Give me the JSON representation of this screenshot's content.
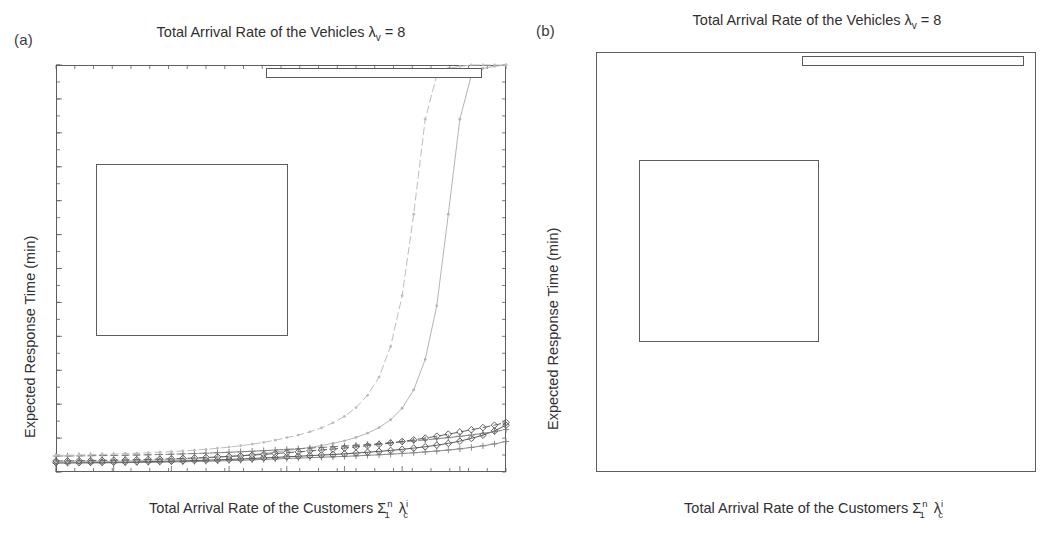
{
  "figure": {
    "panels": [
      {
        "id": "a",
        "label": "(a)",
        "title_main": "Total Arrival Rate of the Vehicles ",
        "title_lambda": "λ",
        "title_lambda_sub": "v",
        "title_tail": " = 8",
        "ylabel": "Expected Response Time (min)",
        "xlabel_main": "Total Arrival Rate of the Customers ",
        "xlabel_sigma": "Σ",
        "xlabel_sigma_sup": "n",
        "xlabel_sigma_sub": "1",
        "xlabel_lambda": "λ",
        "xlabel_lambda_sup": "i",
        "xlabel_lambda_sub": "c",
        "yticks": [
          "0",
          "5",
          "10",
          "15",
          "20",
          "25",
          "30",
          "35",
          "40",
          "45",
          "50",
          "55",
          "60"
        ],
        "xticks": [
          "2",
          "2.5",
          "3",
          "3.5",
          "4",
          "4.5",
          "5",
          "5.5"
        ],
        "legend": [
          "Gaussian/Gaussian,Average",
          "Decreasing/Gaussian, Average",
          "Decreasing/Uniform, Average",
          "Gaussian/Gaussian,Max",
          "Decreasing/Gaussian,Max",
          "Decreasing/Uniform, Max"
        ],
        "inset": {
          "yticks": [
            "1.5",
            "3.5",
            "5.5",
            "7.5",
            "9.5"
          ],
          "xticks": [
            "4.5",
            "5",
            "5.5",
            "5.9"
          ]
        },
        "highlight_box": {
          "x_start": 4.5,
          "y_top": 10
        }
      },
      {
        "id": "b",
        "label": "(b)",
        "title_main": "Total Arrival Rate of the Vehicles ",
        "title_lambda": "λ",
        "title_lambda_sub": "v",
        "title_tail": " = 8",
        "ylabel": "Expected Response Time (min)",
        "xlabel_main": "Total Arrival Rate of the Customers ",
        "xlabel_sigma": "Σ",
        "xlabel_sigma_sup": "n",
        "xlabel_sigma_sub": "1",
        "xlabel_lambda": "λ",
        "xlabel_lambda_sup": "i",
        "xlabel_lambda_sub": "c",
        "yticks": [
          "0",
          "5",
          "10",
          "15",
          "20",
          "25",
          "30",
          "35",
          "40",
          "45",
          "50",
          "55",
          "60"
        ],
        "xticks": [
          "2",
          "2.5",
          "3",
          "3.5",
          "4",
          "4.5",
          "5",
          "5.5"
        ],
        "legend": [
          "Decreasing/Gaussian, Average",
          "Decreasing/Gaussian,Max",
          "Gaussian/Gaussian,Average",
          "Gaussian/Gaussian,Max",
          "Decreasing/Uniform, Average",
          "Decreasing/Uniform, Max"
        ],
        "inset": {
          "yticks": [
            "0",
            "5",
            "10",
            "15"
          ],
          "xticks": [
            "5",
            "5.2",
            "5.4",
            "5.6",
            "5.8"
          ]
        },
        "highlight_box": {
          "x_start": 5.0,
          "y_top": 15
        }
      }
    ]
  },
  "colors": {
    "axis": "#5d5d5d",
    "text": "#303030",
    "gaussian_gaussian_avg": "#8a8a8a",
    "decreasing_gaussian_avg": "#595959",
    "decreasing_uniform_avg": "#b4b4b4",
    "gaussian_gaussian_max": "#7e7e7e",
    "decreasing_gaussian_max": "#606060",
    "decreasing_uniform_max": "#bdbdbd",
    "background": "#ffffff"
  },
  "chart_data": [
    {
      "type": "line",
      "panel": "a",
      "title": "Total Arrival Rate of the Vehicles λ_v = 8",
      "xlabel": "Total Arrival Rate of the Customers Σ_1^n λ_c^i",
      "ylabel": "Expected Response Time (min)",
      "xlim": [
        2,
        5.9
      ],
      "ylim": [
        0,
        60
      ],
      "xticks": [
        2,
        2.5,
        3,
        3.5,
        4,
        4.5,
        5,
        5.5
      ],
      "yticks": [
        0,
        5,
        10,
        15,
        20,
        25,
        30,
        35,
        40,
        45,
        50,
        55,
        60
      ],
      "grid": false,
      "legend_position": "upper-right",
      "x": [
        2.0,
        2.1,
        2.2,
        2.3,
        2.4,
        2.5,
        2.6,
        2.7,
        2.8,
        2.9,
        3.0,
        3.1,
        3.2,
        3.3,
        3.4,
        3.5,
        3.6,
        3.7,
        3.8,
        3.9,
        4.0,
        4.1,
        4.2,
        4.3,
        4.4,
        4.5,
        4.6,
        4.7,
        4.8,
        4.9,
        5.0,
        5.1,
        5.2,
        5.3,
        5.4,
        5.5,
        5.6,
        5.7,
        5.8,
        5.9
      ],
      "series": [
        {
          "name": "Gaussian/Gaussian,Average",
          "style": "solid",
          "marker": "plus",
          "color": "#8a8a8a",
          "values": [
            1.3,
            1.31,
            1.32,
            1.33,
            1.34,
            1.36,
            1.38,
            1.4,
            1.42,
            1.45,
            1.48,
            1.51,
            1.55,
            1.59,
            1.63,
            1.68,
            1.73,
            1.79,
            1.85,
            1.92,
            1.99,
            2.05,
            2.12,
            2.18,
            2.24,
            2.3,
            2.38,
            2.46,
            2.54,
            2.63,
            2.73,
            2.84,
            2.96,
            3.09,
            3.24,
            3.42,
            3.62,
            3.86,
            4.14,
            4.5
          ]
        },
        {
          "name": "Decreasing/Gaussian, Average",
          "style": "solid",
          "marker": "diamond",
          "color": "#595959",
          "values": [
            1.38,
            1.39,
            1.4,
            1.42,
            1.43,
            1.45,
            1.47,
            1.5,
            1.53,
            1.56,
            1.6,
            1.64,
            1.69,
            1.74,
            1.79,
            1.85,
            1.92,
            1.99,
            2.07,
            2.15,
            2.24,
            2.32,
            2.41,
            2.5,
            2.58,
            2.67,
            2.79,
            2.91,
            3.04,
            3.18,
            3.34,
            3.52,
            3.72,
            3.95,
            4.22,
            4.55,
            4.95,
            5.43,
            6.05,
            6.9
          ]
        },
        {
          "name": "Decreasing/Uniform, Average",
          "style": "solid",
          "marker": "dot",
          "color": "#b4b4b4",
          "values": [
            1.45,
            1.47,
            1.49,
            1.52,
            1.55,
            1.58,
            1.62,
            1.66,
            1.71,
            1.77,
            1.83,
            1.9,
            1.98,
            2.07,
            2.17,
            2.28,
            2.41,
            2.56,
            2.73,
            2.93,
            3.16,
            3.38,
            3.62,
            3.9,
            4.22,
            4.6,
            5.1,
            5.72,
            6.55,
            7.7,
            9.4,
            12.1,
            16.6,
            24.5,
            38.0,
            52.0,
            58.5,
            59.5,
            59.8,
            60.0
          ]
        },
        {
          "name": "Gaussian/Gaussian,Max",
          "style": "dashed",
          "marker": "plus",
          "color": "#7e7e7e",
          "values": [
            2.35,
            2.36,
            2.38,
            2.4,
            2.42,
            2.44,
            2.47,
            2.5,
            2.54,
            2.58,
            2.62,
            2.67,
            2.72,
            2.78,
            2.84,
            2.91,
            2.98,
            3.06,
            3.15,
            3.24,
            3.34,
            3.43,
            3.53,
            3.62,
            3.72,
            3.82,
            3.94,
            4.06,
            4.18,
            4.31,
            4.45,
            4.59,
            4.74,
            4.9,
            5.07,
            5.26,
            5.46,
            5.69,
            5.94,
            6.25
          ]
        },
        {
          "name": "Decreasing/Gaussian,Max",
          "style": "dashed",
          "marker": "diamond",
          "color": "#606060",
          "values": [
            1.62,
            1.64,
            1.66,
            1.68,
            1.71,
            1.74,
            1.77,
            1.81,
            1.85,
            1.9,
            1.95,
            2.01,
            2.07,
            2.14,
            2.22,
            2.3,
            2.39,
            2.49,
            2.6,
            2.72,
            2.85,
            2.97,
            3.1,
            3.24,
            3.38,
            3.53,
            3.7,
            3.88,
            4.07,
            4.28,
            4.5,
            4.74,
            5.0,
            5.28,
            5.58,
            5.9,
            6.22,
            6.55,
            6.9,
            7.3
          ]
        },
        {
          "name": "Decreasing/Uniform, Max",
          "style": "dashed",
          "marker": "dot",
          "color": "#bdbdbd",
          "values": [
            2.45,
            2.48,
            2.51,
            2.55,
            2.59,
            2.64,
            2.7,
            2.76,
            2.83,
            2.91,
            3.0,
            3.1,
            3.22,
            3.35,
            3.5,
            3.67,
            3.87,
            4.1,
            4.37,
            4.69,
            5.07,
            5.45,
            5.92,
            6.5,
            7.25,
            8.2,
            9.5,
            11.3,
            14.0,
            18.5,
            26.0,
            38.0,
            52.0,
            58.5,
            59.5,
            59.8,
            60.0,
            60.0,
            60.0,
            60.0
          ]
        }
      ],
      "inset": {
        "xlim": [
          4.5,
          5.9
        ],
        "ylim": [
          1.5,
          9.5
        ],
        "xticks": [
          4.5,
          5,
          5.5,
          5.9
        ],
        "yticks": [
          1.5,
          3.5,
          5.5,
          7.5,
          9.5
        ]
      },
      "annotations": [
        {
          "type": "rect",
          "note": "highlight box on main axes",
          "x_range": [
            4.5,
            5.9
          ],
          "y_range": [
            0,
            10
          ]
        },
        {
          "type": "arrow",
          "note": "connects inset lower-right to highlight box upper-left"
        }
      ]
    },
    {
      "type": "line",
      "panel": "b",
      "title": "Total Arrival Rate of the Vehicles λ_v = 8",
      "xlabel": "Total Arrival Rate of the Customers Σ_1^n λ_c^i",
      "ylabel": "Expected Response Time (min)",
      "xlim": [
        2,
        5.9
      ],
      "ylim": [
        0,
        60
      ],
      "xticks": [
        2,
        2.5,
        3,
        3.5,
        4,
        4.5,
        5,
        5.5
      ],
      "yticks": [
        0,
        5,
        10,
        15,
        20,
        25,
        30,
        35,
        40,
        45,
        50,
        55,
        60
      ],
      "grid": false,
      "legend_position": "upper-right",
      "x": [
        2.0,
        2.1,
        2.2,
        2.3,
        2.4,
        2.5,
        2.6,
        2.7,
        2.8,
        2.9,
        3.0,
        3.1,
        3.2,
        3.3,
        3.4,
        3.5,
        3.6,
        3.7,
        3.8,
        3.9,
        4.0,
        4.1,
        4.2,
        4.3,
        4.4,
        4.5,
        4.6,
        4.7,
        4.8,
        4.9,
        5.0,
        5.1,
        5.2,
        5.3,
        5.4,
        5.5,
        5.6,
        5.7,
        5.8,
        5.9
      ],
      "series": [
        {
          "name": "Decreasing/Gaussian, Average",
          "style": "solid",
          "marker": "diamond",
          "color": "#595959",
          "values": [
            1.38,
            1.39,
            1.4,
            1.42,
            1.43,
            1.45,
            1.47,
            1.5,
            1.53,
            1.56,
            1.6,
            1.64,
            1.69,
            1.74,
            1.79,
            1.85,
            1.92,
            1.99,
            2.07,
            2.15,
            2.24,
            2.32,
            2.41,
            2.5,
            2.58,
            2.67,
            2.79,
            2.91,
            3.04,
            3.18,
            3.34,
            3.52,
            3.72,
            3.95,
            4.22,
            4.55,
            4.95,
            5.43,
            6.05,
            6.6
          ]
        },
        {
          "name": "Decreasing/Gaussian,Max",
          "style": "dashed",
          "marker": "diamond",
          "color": "#606060",
          "values": [
            1.62,
            1.64,
            1.66,
            1.68,
            1.71,
            1.74,
            1.77,
            1.81,
            1.85,
            1.9,
            1.95,
            2.01,
            2.07,
            2.14,
            2.22,
            2.3,
            2.39,
            2.49,
            2.6,
            2.72,
            2.85,
            2.97,
            3.1,
            3.24,
            3.38,
            3.53,
            3.7,
            3.88,
            4.07,
            4.28,
            4.5,
            4.74,
            5.0,
            5.28,
            5.58,
            5.9,
            6.22,
            6.55,
            6.9,
            7.2
          ]
        },
        {
          "name": "Gaussian/Gaussian,Average",
          "style": "solid",
          "marker": "plus",
          "color": "#8a8a8a",
          "values": [
            1.3,
            1.31,
            1.32,
            1.33,
            1.34,
            1.36,
            1.38,
            1.4,
            1.42,
            1.45,
            1.48,
            1.51,
            1.55,
            1.59,
            1.63,
            1.68,
            1.73,
            1.79,
            1.85,
            1.92,
            1.99,
            2.05,
            2.12,
            2.18,
            2.24,
            2.3,
            2.38,
            2.46,
            2.54,
            2.63,
            2.73,
            2.84,
            2.96,
            3.09,
            3.24,
            3.42,
            3.62,
            3.86,
            4.14,
            4.45
          ]
        },
        {
          "name": "Gaussian/Gaussian,Max",
          "style": "dashed",
          "marker": "plus",
          "color": "#7e7e7e",
          "values": [
            2.35,
            2.36,
            2.38,
            2.4,
            2.42,
            2.44,
            2.47,
            2.5,
            2.54,
            2.58,
            2.62,
            2.67,
            2.72,
            2.78,
            2.84,
            2.91,
            2.98,
            3.06,
            3.15,
            3.24,
            3.34,
            3.43,
            3.53,
            3.62,
            3.72,
            3.82,
            3.94,
            4.06,
            4.18,
            4.31,
            4.45,
            4.59,
            4.74,
            4.9,
            5.07,
            5.26,
            5.46,
            5.69,
            5.94,
            6.2
          ]
        },
        {
          "name": "Decreasing/Uniform, Average",
          "style": "solid",
          "marker": "dot",
          "color": "#b4b4b4",
          "values": [
            1.45,
            1.47,
            1.49,
            1.52,
            1.55,
            1.58,
            1.62,
            1.66,
            1.71,
            1.77,
            1.83,
            1.9,
            1.98,
            2.07,
            2.17,
            2.28,
            2.41,
            2.56,
            2.73,
            2.93,
            3.16,
            3.38,
            3.62,
            3.9,
            4.22,
            4.6,
            5.1,
            5.72,
            6.55,
            7.7,
            9.4,
            12.1,
            16.6,
            24.5,
            38.0,
            52.0,
            58.5,
            59.5,
            59.8,
            60.0
          ]
        },
        {
          "name": "Decreasing/Uniform, Max",
          "style": "dashed",
          "marker": "dot",
          "color": "#bdbdbd",
          "values": [
            2.45,
            2.48,
            2.51,
            2.55,
            2.59,
            2.64,
            2.7,
            2.76,
            2.83,
            2.91,
            3.0,
            3.1,
            3.22,
            3.35,
            3.5,
            3.67,
            3.87,
            4.1,
            4.37,
            4.69,
            5.07,
            5.45,
            5.92,
            6.5,
            7.25,
            8.2,
            9.5,
            11.3,
            14.0,
            18.5,
            26.0,
            38.0,
            52.0,
            58.5,
            59.5,
            59.8,
            60.0,
            60.0,
            60.0,
            60.0
          ]
        }
      ],
      "inset": {
        "xlim": [
          5.0,
          5.9
        ],
        "ylim": [
          0,
          15
        ],
        "xticks": [
          5,
          5.2,
          5.4,
          5.6,
          5.8
        ],
        "yticks": [
          0,
          5,
          10,
          15
        ]
      },
      "annotations": [
        {
          "type": "rect",
          "note": "highlight box on main axes",
          "x_range": [
            5.0,
            5.9
          ],
          "y_range": [
            0,
            15
          ]
        },
        {
          "type": "arrow",
          "note": "connects inset lower-right to highlight box upper-left"
        }
      ]
    }
  ]
}
